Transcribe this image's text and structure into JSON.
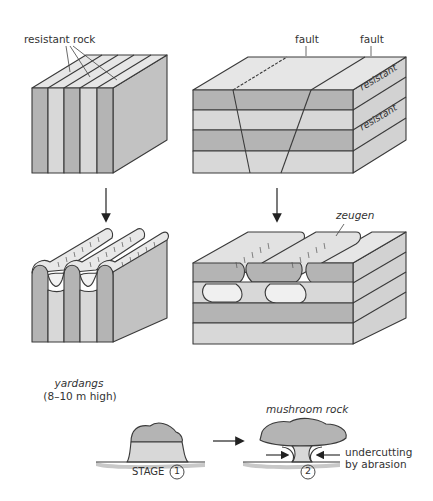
{
  "diagram": {
    "type": "geomorphology-illustration",
    "topic": "wind erosion landforms",
    "colors": {
      "dark_stripe": "#b4b4b4",
      "light_stripe": "#d8d8d8",
      "top_surface": "#e6e6e6",
      "side_face": "#c2c2c2",
      "outline": "#3a3a3a",
      "ground_shadow": "#c8c8c8",
      "hollow": "#efefef"
    },
    "panels": {
      "top_left": {
        "label": "resistant rock",
        "description": "vertical bands of alternating resistant and weak rock"
      },
      "top_right": {
        "fault_labels": [
          "fault",
          "fault"
        ],
        "layer_labels": [
          "resistant",
          "resistant"
        ],
        "description": "horizontal layers cut by two faults"
      },
      "bottom_left": {
        "label": "yardangs",
        "sublabel": "(8–10 m high)"
      },
      "bottom_right": {
        "label": "zeugen"
      }
    },
    "stages": {
      "title": "mushroom rock",
      "stage_word": "STAGE",
      "stage_1": "1",
      "stage_2": "2",
      "annotation_line1": "undercutting",
      "annotation_line2": "by abrasion"
    },
    "arrows": [
      {
        "from": "top_left",
        "to": "bottom_left",
        "direction": "down"
      },
      {
        "from": "top_right",
        "to": "bottom_right",
        "direction": "down"
      },
      {
        "from": "stage_1",
        "to": "stage_2",
        "direction": "right"
      }
    ]
  }
}
